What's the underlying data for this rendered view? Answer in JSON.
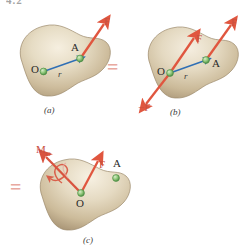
{
  "figure": {
    "clipped_header": "4.2",
    "caption_a": "(a)",
    "caption_b": "(b)",
    "caption_c": "(c)",
    "equals_1": "=",
    "equals_2": "=",
    "colors": {
      "force_red": "#e0563f",
      "force_label_red": "#c8503f",
      "moment_red": "#d9533f",
      "equals_pink": "#e8a9a0",
      "position_vector_blue": "#2f6fb5",
      "point_green": "#8fc77a",
      "point_green_edge": "#4f8f45",
      "body_tan_light": "#efe6d4",
      "body_tan_mid": "#ded0b4",
      "body_tan_dark": "#b8a586",
      "body_outline": "#9c8a6c",
      "label_dark": "#2b2b2b"
    }
  },
  "panel_a": {
    "name": "original-force-at-A",
    "point_O": "O",
    "point_A": "A",
    "vector_r": "r",
    "force_F": "F"
  },
  "panel_b": {
    "name": "equal-and-opposite-pair-added-at-O",
    "point_O": "O",
    "point_A": "A",
    "vector_r": "r",
    "force_F_at_A": "F",
    "force_F_at_O": "F",
    "force_minus_F_at_O": "−F"
  },
  "panel_c": {
    "name": "force-moment-system-at-O",
    "point_O": "O",
    "point_A": "A",
    "force_F": "F",
    "moment_M": "M",
    "moment_sub": "O"
  }
}
